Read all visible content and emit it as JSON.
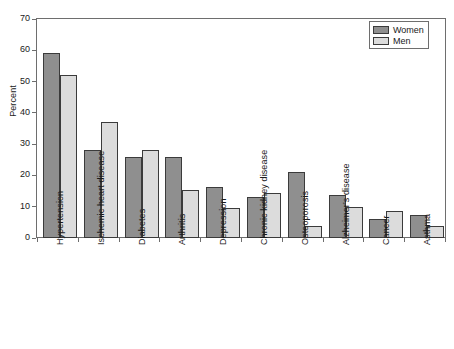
{
  "chart_data": {
    "type": "bar",
    "title": "",
    "xlabel": "",
    "ylabel": "Percent",
    "ylim": [
      0,
      70
    ],
    "yticks": [
      0,
      10,
      20,
      30,
      40,
      50,
      60,
      70
    ],
    "grid": false,
    "legend_position": "top-right",
    "categories": [
      "Hypertension",
      "Ischemic heart disease",
      "Diabetes",
      "Arthritis",
      "Depression",
      "Chronic kidney disease",
      "Osteoporosis",
      "Alzheimer's disease",
      "Cancer",
      "Asthma"
    ],
    "series": [
      {
        "name": "Women",
        "color": "#8f8f8f",
        "values": [
          59,
          28,
          26,
          26,
          16.3,
          13,
          21,
          13.7,
          6,
          7.4
        ]
      },
      {
        "name": "Men",
        "color": "#dcdcdc",
        "values": [
          52,
          37,
          28,
          15.5,
          9.5,
          14.3,
          4,
          9.8,
          8.7,
          4
        ]
      }
    ]
  },
  "legend": {
    "items": [
      {
        "label": "Women",
        "swatch": "women"
      },
      {
        "label": "Men",
        "swatch": "men"
      }
    ]
  }
}
